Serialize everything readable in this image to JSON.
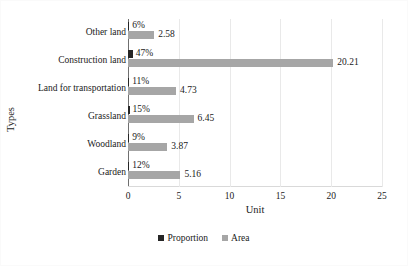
{
  "chart_data": {
    "type": "bar",
    "orientation": "horizontal",
    "title": "",
    "xlabel": "Unit",
    "ylabel": "Types",
    "xlim": [
      0,
      25
    ],
    "xticks": [
      0,
      5,
      10,
      15,
      20,
      25
    ],
    "xtick_labels": [
      "0",
      "5",
      "10",
      "15",
      "20",
      "25"
    ],
    "grid": true,
    "grid_axis": "x",
    "legend_position": "bottom-center",
    "categories": [
      "Garden",
      "Woodland",
      "Grassland",
      "Land for transportation",
      "Construction land",
      "Other land"
    ],
    "categories_top_to_bottom": [
      "Other land",
      "Construction land",
      "Land for transportation",
      "Grassland",
      "Woodland",
      "Garden"
    ],
    "series": [
      {
        "name": "Proportion",
        "color": "#262626",
        "unit": "%",
        "values": [
          0.12,
          0.09,
          0.15,
          0.11,
          0.47,
          0.06
        ],
        "labels": [
          "12%",
          "9%",
          "15%",
          "11%",
          "47%",
          "6%"
        ]
      },
      {
        "name": "Area",
        "color": "#a6a6a6",
        "unit": "",
        "values": [
          5.16,
          3.87,
          6.45,
          4.73,
          20.21,
          2.58
        ],
        "labels": [
          "5.16",
          "3.87",
          "6.45",
          "4.73",
          "20.21",
          "2.58"
        ]
      }
    ],
    "rows": [
      {
        "category": "Other land",
        "proportion": 0.06,
        "proportion_label": "6%",
        "area": 2.58,
        "area_label": "2.58"
      },
      {
        "category": "Construction land",
        "proportion": 0.47,
        "proportion_label": "47%",
        "area": 20.21,
        "area_label": "20.21"
      },
      {
        "category": "Land for transportation",
        "proportion": 0.11,
        "proportion_label": "11%",
        "area": 4.73,
        "area_label": "4.73"
      },
      {
        "category": "Grassland",
        "proportion": 0.15,
        "proportion_label": "15%",
        "area": 6.45,
        "area_label": "6.45"
      },
      {
        "category": "Woodland",
        "proportion": 0.09,
        "proportion_label": "9%",
        "area": 3.87,
        "area_label": "3.87"
      },
      {
        "category": "Garden",
        "proportion": 0.12,
        "proportion_label": "12%",
        "area": 5.16,
        "area_label": "5.16"
      }
    ]
  },
  "legend": {
    "items": [
      {
        "label": "Proportion",
        "color": "#262626"
      },
      {
        "label": "Area",
        "color": "#a6a6a6"
      }
    ]
  },
  "axes": {
    "x_title": "Unit",
    "y_title": "Types"
  }
}
